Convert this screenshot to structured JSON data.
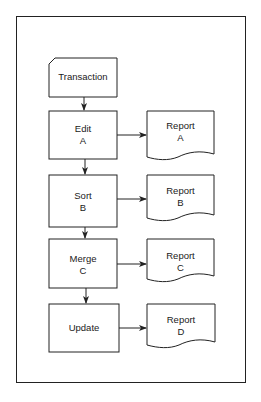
{
  "diagram": {
    "type": "flowchart",
    "nodes": [
      {
        "id": "transaction",
        "shape": "card",
        "lines": [
          "Transaction"
        ]
      },
      {
        "id": "edit",
        "shape": "process",
        "lines": [
          "Edit",
          "A"
        ]
      },
      {
        "id": "sort",
        "shape": "process",
        "lines": [
          "Sort",
          "B"
        ]
      },
      {
        "id": "merge",
        "shape": "process",
        "lines": [
          "Merge",
          "C"
        ]
      },
      {
        "id": "update",
        "shape": "process",
        "lines": [
          "Update"
        ]
      },
      {
        "id": "report_a",
        "shape": "document",
        "lines": [
          "Report",
          "A"
        ]
      },
      {
        "id": "report_b",
        "shape": "document",
        "lines": [
          "Report",
          "B"
        ]
      },
      {
        "id": "report_c",
        "shape": "document",
        "lines": [
          "Report",
          "C"
        ]
      },
      {
        "id": "report_d",
        "shape": "document",
        "lines": [
          "Report",
          "D"
        ]
      }
    ],
    "edges": [
      {
        "from": "transaction",
        "to": "edit"
      },
      {
        "from": "edit",
        "to": "sort"
      },
      {
        "from": "sort",
        "to": "merge"
      },
      {
        "from": "merge",
        "to": "update"
      },
      {
        "from": "edit",
        "to": "report_a"
      },
      {
        "from": "sort",
        "to": "report_b"
      },
      {
        "from": "merge",
        "to": "report_c"
      },
      {
        "from": "update",
        "to": "report_d"
      }
    ],
    "colors": {
      "stroke": "#222222",
      "fill": "#ffffff",
      "text": "#1a1a1a"
    }
  }
}
